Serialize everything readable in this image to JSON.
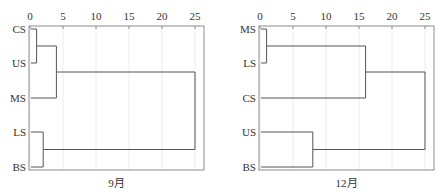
{
  "chart_data": [
    {
      "type": "dendrogram",
      "title": "",
      "caption": "9月",
      "xlabel": "",
      "ylabel": "",
      "xlim": [
        0,
        26
      ],
      "xticks": [
        0,
        5,
        10,
        15,
        20,
        25
      ],
      "xtick_position": "top",
      "grid": "vertical light gridlines at each tick",
      "leaves": [
        "CS",
        "US",
        "MS",
        "LS",
        "BS"
      ],
      "merges": [
        {
          "members": [
            "CS",
            "US"
          ],
          "distance": 1
        },
        {
          "members": [
            "CS",
            "US",
            "MS"
          ],
          "distance": 4
        },
        {
          "members": [
            "LS",
            "BS"
          ],
          "distance": 2
        },
        {
          "members": [
            "CS",
            "US",
            "MS",
            "LS",
            "BS"
          ],
          "distance": 25
        }
      ]
    },
    {
      "type": "dendrogram",
      "title": "",
      "caption": "12月",
      "xlabel": "",
      "ylabel": "",
      "xlim": [
        0,
        26
      ],
      "xticks": [
        0,
        5,
        10,
        15,
        20,
        25
      ],
      "xtick_position": "top",
      "grid": "vertical light gridlines at each tick",
      "leaves": [
        "MS",
        "LS",
        "CS",
        "US",
        "BS"
      ],
      "merges": [
        {
          "members": [
            "MS",
            "LS"
          ],
          "distance": 1
        },
        {
          "members": [
            "MS",
            "LS",
            "CS"
          ],
          "distance": 16
        },
        {
          "members": [
            "US",
            "BS"
          ],
          "distance": 8
        },
        {
          "members": [
            "MS",
            "LS",
            "CS",
            "US",
            "BS"
          ],
          "distance": 25
        }
      ]
    }
  ],
  "panels": [
    {
      "caption": "9月",
      "left": 29,
      "right": 204,
      "zero_x": 30,
      "unit": 6.6
    },
    {
      "caption": "12月",
      "left": 259,
      "right": 434,
      "zero_x": 260,
      "unit": 6.6
    }
  ],
  "layout": {
    "top": 26,
    "bottom": 170,
    "row_y": [
      29,
      63,
      98,
      132,
      167
    ],
    "caption_y": 187
  },
  "colors": {
    "frame": "#8c8c8c",
    "line": "#555555",
    "grid": "#ececec",
    "text": "#333333"
  }
}
